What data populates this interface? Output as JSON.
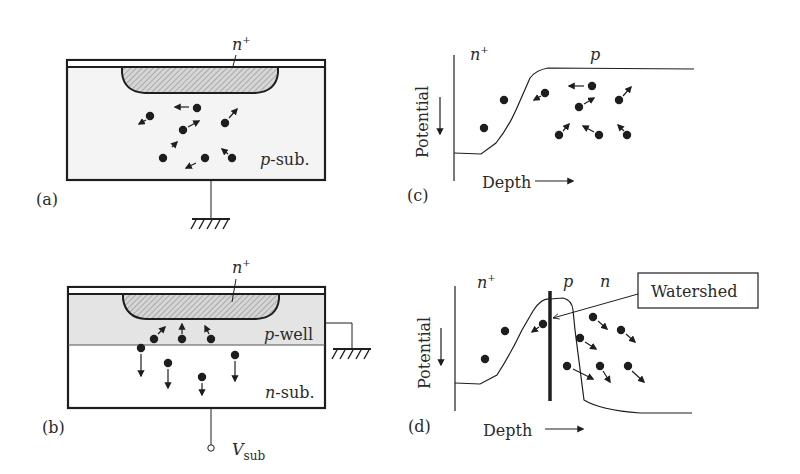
{
  "figure": {
    "colors": {
      "ink": "#1e1e1e",
      "substrate_fill": "#f4f4f4",
      "well_fill": "#e4e4e4",
      "nplus_fill": "#cfcfcf",
      "background": "#ffffff"
    },
    "panel_a": {
      "label": "(a)",
      "nplus_label": "n",
      "nplus_sup": "+",
      "substrate_label_italic": "p",
      "substrate_label_rest": "-sub.",
      "ground": "ground-symbol"
    },
    "panel_b": {
      "label": "(b)",
      "nplus_label": "n",
      "nplus_sup": "+",
      "well_label_italic": "p",
      "well_label_rest": "-well",
      "substrate_label_italic": "n",
      "substrate_label_rest": "-sub.",
      "terminal_label": "V",
      "terminal_sub": "sub",
      "ground": "ground-symbol"
    },
    "panel_c": {
      "label": "(c)",
      "y_axis_label": "Potential",
      "x_axis_label": "Depth",
      "region_left": "n",
      "region_left_sup": "+",
      "region_right": "p"
    },
    "panel_d": {
      "label": "(d)",
      "y_axis_label": "Potential",
      "x_axis_label": "Depth",
      "region_left": "n",
      "region_left_sup": "+",
      "region_mid": "p",
      "region_right": "n",
      "callout": "Watershed"
    }
  }
}
